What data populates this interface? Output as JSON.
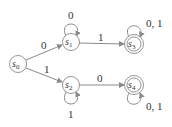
{
  "diagram": {
    "type": "finite-state-machine",
    "states": [
      {
        "id": "s0",
        "name": "s",
        "sub": "0",
        "accepting": false,
        "start": true
      },
      {
        "id": "s1",
        "name": "s",
        "sub": "1",
        "accepting": false
      },
      {
        "id": "s2",
        "name": "s",
        "sub": "2",
        "accepting": false
      },
      {
        "id": "s3",
        "name": "s",
        "sub": "3",
        "accepting": true
      },
      {
        "id": "s4",
        "name": "s",
        "sub": "4",
        "accepting": true
      }
    ],
    "transitions": [
      {
        "from": "s0",
        "to": "s1",
        "label": "0"
      },
      {
        "from": "s0",
        "to": "s2",
        "label": "1"
      },
      {
        "from": "s1",
        "to": "s1",
        "label": "0"
      },
      {
        "from": "s1",
        "to": "s3",
        "label": "1"
      },
      {
        "from": "s2",
        "to": "s2",
        "label": "1"
      },
      {
        "from": "s2",
        "to": "s4",
        "label": "0"
      },
      {
        "from": "s3",
        "to": "s3",
        "label": "0, 1"
      },
      {
        "from": "s4",
        "to": "s4",
        "label": "0, 1"
      }
    ],
    "colors": {
      "stroke": "#8a8a8a",
      "text": "#333333"
    }
  }
}
